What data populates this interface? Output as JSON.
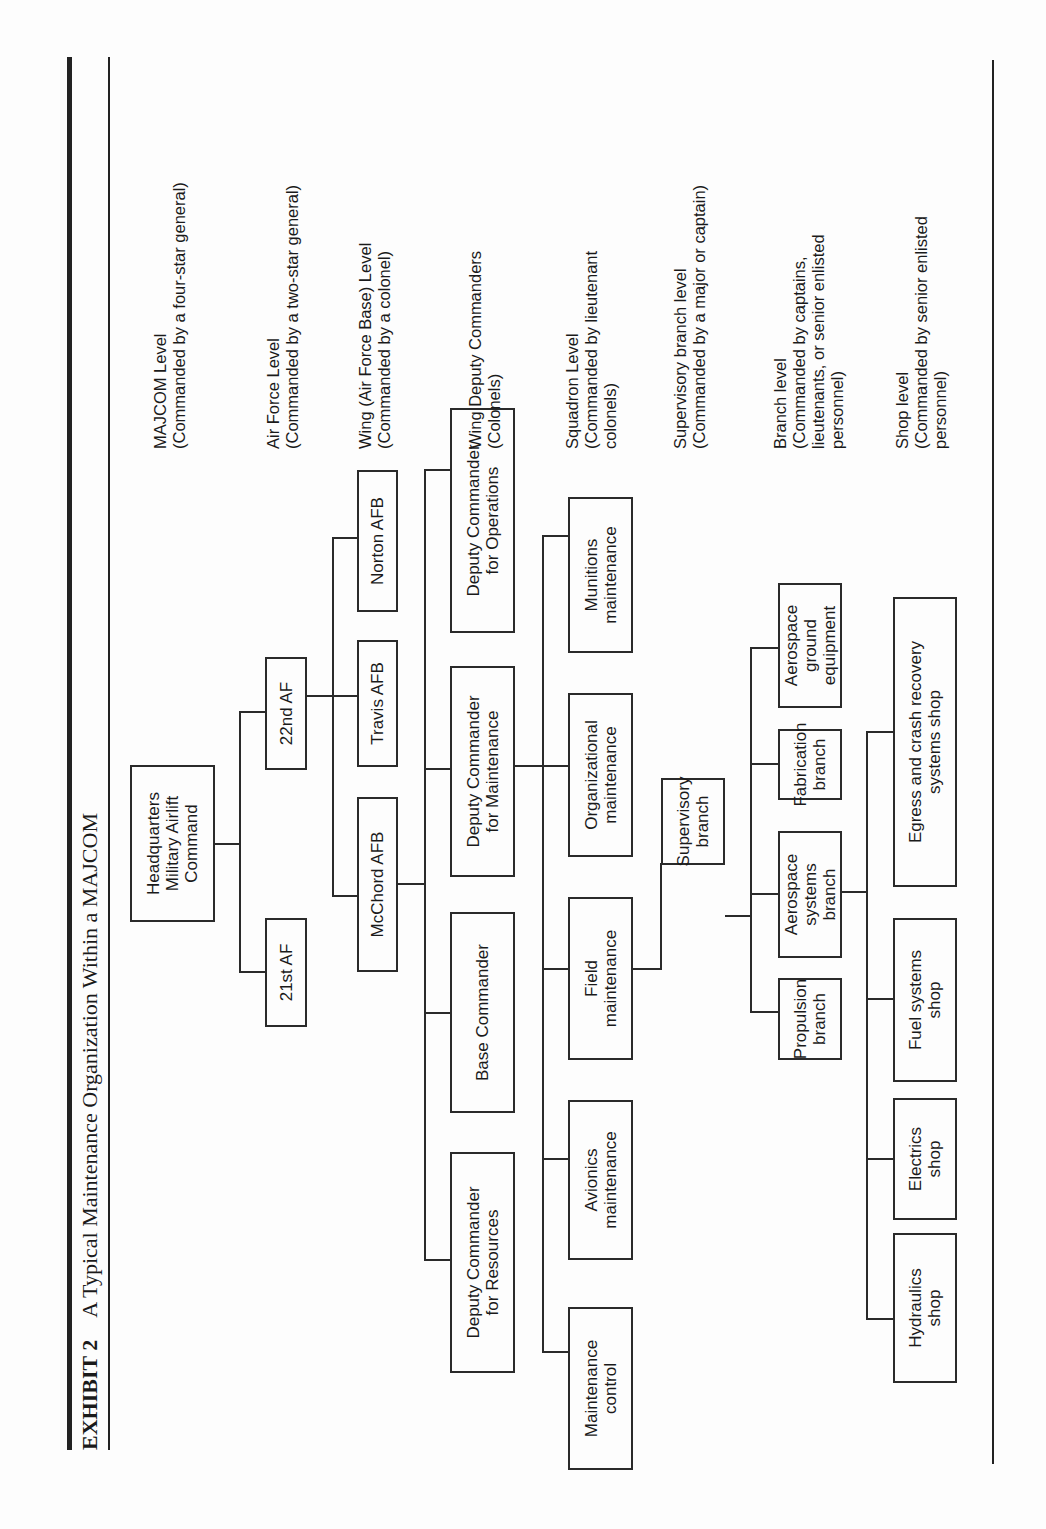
{
  "running_head": "Military Logistics Organization",
  "title": {
    "exhibit": "EXHIBIT 2",
    "text": "A Typical Maintenance Organization Within a MAJCOM"
  },
  "nodes": {
    "hq": [
      "Headquarters",
      "Military Airlift",
      "Command"
    ],
    "af21": [
      "21st AF"
    ],
    "af22": [
      "22nd AF"
    ],
    "mcchord": [
      "McChord AFB"
    ],
    "travis": [
      "Travis AFB"
    ],
    "norton": [
      "Norton AFB"
    ],
    "dc_resources": [
      "Deputy Commander",
      "for Resources"
    ],
    "base_commander": [
      "Base Commander"
    ],
    "dc_maintenance": [
      "Deputy Commander",
      "for Maintenance"
    ],
    "dc_operations": [
      "Deputy Commander",
      "for Operations"
    ],
    "maintenance_control": [
      "Maintenance",
      "control"
    ],
    "avionics": [
      "Avionics",
      "maintenance"
    ],
    "field": [
      "Field",
      "maintenance"
    ],
    "organizational": [
      "Organizational",
      "maintenance"
    ],
    "munitions": [
      "Munitions",
      "maintenance"
    ],
    "supervisory": [
      "Supervisory",
      "branch"
    ],
    "propulsion": [
      "Propulsion",
      "branch"
    ],
    "aerospace_systems": [
      "Aerospace systems",
      "branch"
    ],
    "fabrication": [
      "Fabrication",
      "branch"
    ],
    "age": [
      "Aerospace",
      "ground equipment"
    ],
    "hydraulics": [
      "Hydraulics",
      "shop"
    ],
    "electrics": [
      "Electrics",
      "shop"
    ],
    "fuel": [
      "Fuel systems",
      "shop"
    ],
    "egress": [
      "Egress and crash recovery",
      "systems shop"
    ]
  },
  "levels": {
    "majcom": [
      "MAJCOM Level",
      "(Commanded by a four-star general)"
    ],
    "air_force": [
      "Air Force Level",
      "(Commanded by a two-star general)"
    ],
    "wing": [
      "Wing (Air Force Base) Level",
      "(Commanded by a colonel)"
    ],
    "wing_deputy": [
      "Wing Deputy Commanders",
      "(Colonels)"
    ],
    "squadron": [
      "Squadron Level",
      "(Commanded by lieutenant",
      "colonels)"
    ],
    "supervisory": [
      "Supervisory branch level",
      "(Commanded by a major or captain)"
    ],
    "branch": [
      "Branch level",
      "(Commanded by captains,",
      "lieutenants, or senior enlisted",
      "personnel)"
    ],
    "shop": [
      "Shop level",
      "(Commanded by senior enlisted",
      "personnel)"
    ]
  }
}
